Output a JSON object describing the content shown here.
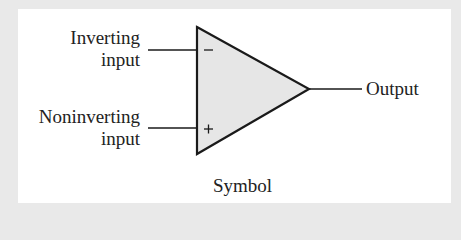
{
  "figure": {
    "caption": "Symbol",
    "component": "operational amplifier",
    "inputs": [
      {
        "line1": "Inverting",
        "line2": "input",
        "sign": "−"
      },
      {
        "line1": "Noninverting",
        "line2": "input",
        "sign": "+"
      }
    ],
    "output": {
      "label": "Output"
    },
    "colors": {
      "background": "#e9e9e9",
      "panel": "#ffffff",
      "triangle_fill": "#e6e6e6",
      "stroke": "#1a1a1a"
    }
  }
}
